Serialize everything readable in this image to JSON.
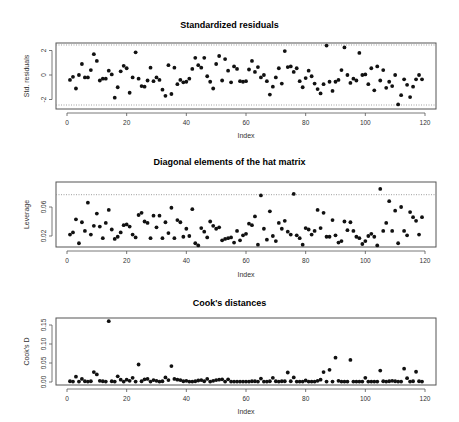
{
  "chart_data": [
    {
      "type": "scatter",
      "title": "Standardized residuals",
      "xlabel": "Index",
      "ylabel": "Std. residuals",
      "xlim": [
        0,
        120
      ],
      "ylim": [
        -2.6,
        2.6
      ],
      "xticks": [
        0,
        20,
        40,
        60,
        80,
        100,
        120
      ],
      "yticks": [
        -2,
        0,
        2
      ],
      "ytick_labels": [
        "-2",
        "0",
        "2"
      ],
      "reference_lines": [
        2.45,
        -2.45
      ],
      "x": [
        1,
        2,
        3,
        4,
        5,
        6,
        7,
        8,
        9,
        10,
        11,
        12,
        13,
        14,
        15,
        16,
        17,
        18,
        19,
        20,
        21,
        22,
        23,
        24,
        25,
        26,
        27,
        28,
        29,
        30,
        31,
        32,
        33,
        34,
        35,
        36,
        37,
        38,
        39,
        40,
        41,
        42,
        43,
        44,
        45,
        46,
        47,
        48,
        49,
        50,
        51,
        52,
        53,
        54,
        55,
        56,
        57,
        58,
        59,
        60,
        61,
        62,
        63,
        64,
        65,
        66,
        67,
        68,
        69,
        70,
        71,
        72,
        73,
        74,
        75,
        76,
        77,
        78,
        79,
        80,
        81,
        82,
        83,
        84,
        85,
        86,
        87,
        88,
        89,
        90,
        91,
        92,
        93,
        94,
        95,
        96,
        97,
        98,
        99,
        100,
        101,
        102,
        103,
        104,
        105,
        106,
        107,
        108,
        109,
        110,
        111,
        112,
        113,
        114,
        115,
        116,
        117,
        118,
        119
      ],
      "values": [
        -0.4,
        -0.15,
        -1.1,
        0.0,
        0.9,
        -0.2,
        -0.2,
        0.4,
        1.7,
        1.15,
        -0.45,
        -0.3,
        -0.3,
        0.35,
        0.05,
        -1.85,
        -1.0,
        0.3,
        0.75,
        0.55,
        -1.45,
        -0.2,
        1.85,
        -0.3,
        -0.9,
        -0.95,
        -0.45,
        0.6,
        -0.5,
        -0.2,
        -0.4,
        -1.2,
        -1.7,
        0.8,
        -1.55,
        0.6,
        -0.75,
        -0.4,
        -0.6,
        -0.55,
        -0.3,
        0.5,
        1.4,
        0.8,
        0.6,
        1.4,
        -0.1,
        -0.55,
        -1.1,
        0.9,
        1.55,
        -0.45,
        1.3,
        0.35,
        -0.6,
        0.7,
        0.5,
        -0.5,
        -0.55,
        -0.5,
        0.45,
        1.15,
        0.25,
        0.65,
        -0.2,
        0.0,
        -0.5,
        -1.6,
        -0.95,
        -0.2,
        0.55,
        -0.7,
        1.95,
        0.65,
        0.7,
        0.25,
        0.55,
        -0.5,
        -1.0,
        -0.25,
        0.35,
        -0.1,
        -0.7,
        -1.15,
        -1.5,
        -0.75,
        2.4,
        -0.55,
        -1.3,
        -0.55,
        -0.4,
        0.4,
        2.25,
        0.0,
        -0.65,
        -0.3,
        -0.45,
        1.8,
        0.0,
        0.05,
        -0.75,
        0.55,
        -1.25,
        0.7,
        -0.45,
        0.4,
        -1.05,
        -0.55,
        -0.9,
        0.0,
        -2.4,
        -1.65,
        -0.35,
        -0.8,
        -1.8,
        -0.95,
        -0.35,
        0.0,
        -0.35
      ]
    },
    {
      "type": "scatter",
      "title": "Diagonal elements of the hat matrix",
      "xlabel": "Index",
      "ylabel": "Leverage",
      "xlim": [
        0,
        120
      ],
      "ylim": [
        0.005,
        0.09
      ],
      "xticks": [
        0,
        20,
        40,
        60,
        80,
        100,
        120
      ],
      "yticks": [
        0.02,
        0.06
      ],
      "ytick_labels": [
        "0.02",
        "0.06"
      ],
      "reference_lines": [
        0.077
      ],
      "x": [
        1,
        2,
        3,
        4,
        5,
        6,
        7,
        8,
        9,
        10,
        11,
        12,
        13,
        14,
        15,
        16,
        17,
        18,
        19,
        20,
        21,
        22,
        23,
        24,
        25,
        26,
        27,
        28,
        29,
        30,
        31,
        32,
        33,
        34,
        35,
        36,
        37,
        38,
        39,
        40,
        41,
        42,
        43,
        44,
        45,
        46,
        47,
        48,
        49,
        50,
        51,
        52,
        53,
        54,
        55,
        56,
        57,
        58,
        59,
        60,
        61,
        62,
        63,
        64,
        65,
        66,
        67,
        68,
        69,
        70,
        71,
        72,
        73,
        74,
        75,
        76,
        77,
        78,
        79,
        80,
        81,
        82,
        83,
        84,
        85,
        86,
        87,
        88,
        89,
        90,
        91,
        92,
        93,
        94,
        95,
        96,
        97,
        98,
        99,
        100,
        101,
        102,
        103,
        104,
        105,
        106,
        107,
        108,
        109,
        110,
        111,
        112,
        113,
        114,
        115,
        116,
        117,
        118,
        119
      ],
      "values": [
        0.022,
        0.025,
        0.043,
        0.01,
        0.039,
        0.027,
        0.066,
        0.022,
        0.034,
        0.051,
        0.033,
        0.017,
        0.038,
        0.056,
        0.029,
        0.016,
        0.019,
        0.025,
        0.035,
        0.036,
        0.033,
        0.022,
        0.018,
        0.049,
        0.052,
        0.04,
        0.038,
        0.017,
        0.048,
        0.032,
        0.048,
        0.017,
        0.039,
        0.024,
        0.059,
        0.017,
        0.042,
        0.039,
        0.019,
        0.03,
        0.02,
        0.057,
        0.01,
        0.007,
        0.031,
        0.026,
        0.018,
        0.04,
        0.034,
        0.03,
        0.032,
        0.014,
        0.016,
        0.017,
        0.018,
        0.011,
        0.027,
        0.014,
        0.021,
        0.023,
        0.037,
        0.035,
        0.047,
        0.008,
        0.076,
        0.03,
        0.015,
        0.054,
        0.02,
        0.013,
        0.038,
        0.03,
        0.041,
        0.026,
        0.022,
        0.078,
        0.021,
        0.017,
        0.008,
        0.031,
        0.029,
        0.022,
        0.027,
        0.056,
        0.031,
        0.052,
        0.019,
        0.019,
        0.042,
        0.021,
        0.011,
        0.013,
        0.04,
        0.028,
        0.039,
        0.027,
        0.019,
        0.017,
        0.009,
        0.013,
        0.02,
        0.023,
        0.019,
        0.007,
        0.085,
        0.027,
        0.038,
        0.068,
        0.027,
        0.055,
        0.01,
        0.06,
        0.027,
        0.021,
        0.053,
        0.046,
        0.041,
        0.022,
        0.046
      ]
    },
    {
      "type": "scatter",
      "title": "Cook's distances",
      "xlabel": "Index",
      "ylabel": "Cook's D",
      "xlim": [
        0,
        120
      ],
      "ylim": [
        -0.005,
        0.17
      ],
      "xticks": [
        0,
        20,
        40,
        60,
        80,
        100,
        120
      ],
      "yticks": [
        0.0,
        0.05,
        0.1,
        0.15
      ],
      "ytick_labels": [
        "0.00",
        "0.05",
        "0.10",
        "0.15"
      ],
      "x": [
        1,
        2,
        3,
        4,
        5,
        6,
        7,
        8,
        9,
        10,
        11,
        12,
        13,
        14,
        15,
        16,
        17,
        18,
        19,
        20,
        21,
        22,
        23,
        24,
        25,
        26,
        27,
        28,
        29,
        30,
        31,
        32,
        33,
        34,
        35,
        36,
        37,
        38,
        39,
        40,
        41,
        42,
        43,
        44,
        45,
        46,
        47,
        48,
        49,
        50,
        51,
        52,
        53,
        54,
        55,
        56,
        57,
        58,
        59,
        60,
        61,
        62,
        63,
        64,
        65,
        66,
        67,
        68,
        69,
        70,
        71,
        72,
        73,
        74,
        75,
        76,
        77,
        78,
        79,
        80,
        81,
        82,
        83,
        84,
        85,
        86,
        87,
        88,
        89,
        90,
        91,
        92,
        93,
        94,
        95,
        96,
        97,
        98,
        99,
        100,
        101,
        102,
        103,
        104,
        105,
        106,
        107,
        108,
        109,
        110,
        111,
        112,
        113,
        114,
        115,
        116,
        117,
        118,
        119
      ],
      "values": [
        0.002,
        0.001,
        0.014,
        0.001,
        0.008,
        0.002,
        0.001,
        0.002,
        0.026,
        0.02,
        0.003,
        0.002,
        0.001,
        0.16,
        0.002,
        0.001,
        0.015,
        0.006,
        0.001,
        0.006,
        0.003,
        0.011,
        0.001,
        0.046,
        0.002,
        0.007,
        0.008,
        0.001,
        0.005,
        0.003,
        0.001,
        0.002,
        0.012,
        0.005,
        0.042,
        0.008,
        0.006,
        0.005,
        0.002,
        0.003,
        0.001,
        0.001,
        0.002,
        0.004,
        0.005,
        0.002,
        0.008,
        0.001,
        0.003,
        0.005,
        0.006,
        0.007,
        0.001,
        0.007,
        0.001,
        0.001,
        0.001,
        0.001,
        0.001,
        0.001,
        0.001,
        0.002,
        0.002,
        0.001,
        0.009,
        0.001,
        0.001,
        0.002,
        0.011,
        0.002,
        0.001,
        0.002,
        0.002,
        0.025,
        0.002,
        0.012,
        0.001,
        0.001,
        0.001,
        0.004,
        0.001,
        0.001,
        0.001,
        0.003,
        0.006,
        0.026,
        0.001,
        0.032,
        0.001,
        0.064,
        0.003,
        0.001,
        0.001,
        0.001,
        0.058,
        0.001,
        0.001,
        0.001,
        0.001,
        0.011,
        0.001,
        0.001,
        0.001,
        0.001,
        0.03,
        0.002,
        0.001,
        0.002,
        0.003,
        0.002,
        0.001,
        0.001,
        0.035,
        0.01,
        0.001,
        0.002,
        0.027,
        0.002,
        0.001
      ]
    }
  ],
  "panels": [
    {
      "title": "Standardized residuals",
      "ylabel": "Std. residuals",
      "xlabel": "Index"
    },
    {
      "title": "Diagonal elements of the hat matrix",
      "ylabel": "Leverage",
      "xlabel": "Index"
    },
    {
      "title": "Cook's distances",
      "ylabel": "Cook's D",
      "xlabel": "Index"
    }
  ],
  "colors": {
    "points": "#111111",
    "axis": "#555555",
    "reference_line": "#888888",
    "text": "#333333"
  }
}
